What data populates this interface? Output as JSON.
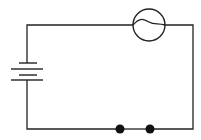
{
  "diagram": {
    "components": [
      {
        "type": "battery",
        "label": "battery",
        "cells": 2
      },
      {
        "type": "lamp",
        "label": "lamp"
      },
      {
        "type": "terminals",
        "label": "open contacts (switch gap)",
        "count": 2
      }
    ],
    "colors": {
      "wire": "#222222",
      "background": "#ffffff"
    }
  }
}
